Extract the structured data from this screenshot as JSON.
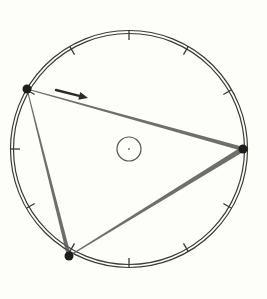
{
  "diagram": {
    "type": "inscribed-triangle-in-circle",
    "background": "#fdfdf9",
    "stroke_color": "#3a3a3a",
    "outer_circle": {
      "cx": 129,
      "cy": 149,
      "r": 117,
      "double_line_gap": 3,
      "tick_count": 12,
      "tick_length": 8
    },
    "center_circle": {
      "cx": 129,
      "cy": 149,
      "r": 12
    },
    "vertices": [
      {
        "name": "A",
        "x": 27,
        "y": 89
      },
      {
        "name": "B",
        "x": 243,
        "y": 149
      },
      {
        "name": "C",
        "x": 69,
        "y": 256
      }
    ],
    "arrow": {
      "x1": 56,
      "y1": 90,
      "x2": 88,
      "y2": 98,
      "direction": "clockwise"
    }
  }
}
